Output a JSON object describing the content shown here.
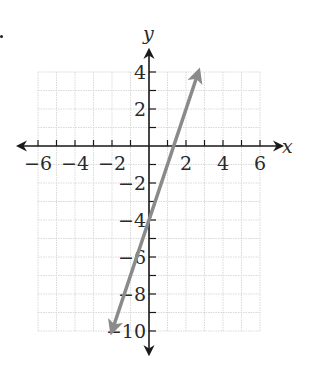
{
  "chart_data": {
    "type": "line",
    "title": "",
    "xlabel": "x",
    "ylabel": "y",
    "xlim": [
      -6,
      6
    ],
    "ylim": [
      -10,
      4
    ],
    "grid": true,
    "x_ticks": [
      -6,
      -5,
      -4,
      -3,
      -2,
      -1,
      0,
      1,
      2,
      3,
      4,
      5,
      6
    ],
    "y_ticks": [
      4,
      3,
      2,
      1,
      0,
      -1,
      -2,
      -3,
      -4,
      -5,
      -6,
      -7,
      -8,
      -9,
      -10
    ],
    "x_tick_labels": [
      "−6",
      "−4",
      "−2",
      "2",
      "4",
      "6"
    ],
    "y_tick_labels": [
      "4",
      "2",
      "−2",
      "−4",
      "−6",
      "−8",
      "−10"
    ],
    "series": [
      {
        "name": "y = 3x − 4",
        "equation": "y = 3x - 4",
        "slope": 3,
        "y_intercept": -4,
        "x_intercept": 1.33,
        "points": [
          [
            -2,
            -10
          ],
          [
            0,
            -4
          ],
          [
            1.33,
            0
          ],
          [
            2.67,
            4
          ]
        ],
        "color": "#8a8a8a",
        "arrows": "both"
      }
    ]
  },
  "colors": {
    "grid": "#d9d9d9",
    "axis": "#1a1a1a",
    "line": "#8a8a8a",
    "text": "#2a2a2a"
  }
}
